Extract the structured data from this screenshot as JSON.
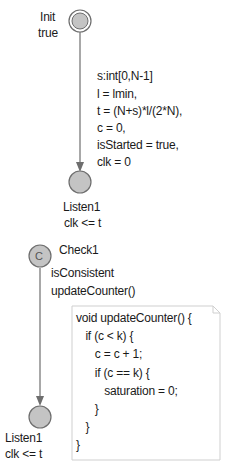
{
  "colors": {
    "state_fill": "#c4c4c4",
    "state_stroke": "#6e6e6e",
    "edge": "#6e6e6e",
    "note_border": "#cfcfcf",
    "text": "#1a1a1a"
  },
  "states": {
    "init": {
      "name": "Init",
      "invariant": "true",
      "type": "initial"
    },
    "listen1_top": {
      "name": "Listen1",
      "invariant": "clk <= t",
      "type": "normal"
    },
    "check1": {
      "name": "Check1",
      "type": "committed",
      "marker": "C"
    },
    "listen1_bottom": {
      "name": "Listen1",
      "invariant": "clk <= t",
      "type": "normal"
    }
  },
  "edges": {
    "init_to_listen": {
      "select": "s:int[0,N-1]",
      "updates": [
        "l = lmin,",
        "t = (N+s)*l/(2*N),",
        "c = 0,",
        "isStarted = true,",
        "clk = 0"
      ]
    },
    "check_to_listen": {
      "guard": "isConsistent",
      "update": "updateCounter()"
    }
  },
  "note": {
    "lines": [
      "void updateCounter() {",
      "   if (c < k) {",
      "      c = c + 1;",
      "      if (c == k) {",
      "         saturation = 0;",
      "      }",
      "   }",
      "}"
    ]
  }
}
